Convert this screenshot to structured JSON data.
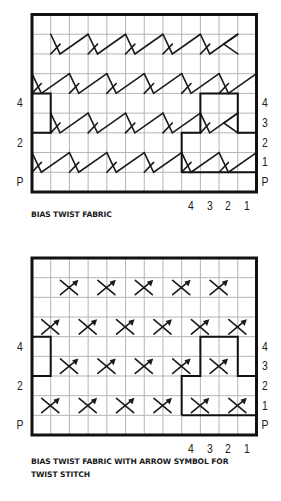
{
  "charts": [
    {
      "id": "bias-twist-fabric",
      "caption_lines": [
        "BIAS TWIST FABRIC"
      ],
      "symbol": "twist-line",
      "grid": {
        "cols": 12,
        "rows": 9,
        "left": 32,
        "top": 14.5,
        "right": 256.5,
        "bottom": 192
      },
      "left_labels": [
        {
          "row": 5,
          "text": "4"
        },
        {
          "row": 7,
          "text": "2"
        },
        {
          "row": 9,
          "text": "P"
        }
      ],
      "right_labels": [
        {
          "row": 5,
          "text": "4"
        },
        {
          "row": 6,
          "text": "3"
        },
        {
          "row": 7,
          "text": "2"
        },
        {
          "row": 8,
          "text": "1"
        },
        {
          "row": 9,
          "text": "P"
        }
      ],
      "bottom_labels": [
        {
          "col": 9,
          "text": "4"
        },
        {
          "col": 10,
          "text": "3"
        },
        {
          "col": 11,
          "text": "2"
        },
        {
          "col": 12,
          "text": "1"
        }
      ],
      "twists": [
        {
          "row": 2,
          "starts": [
            2,
            4,
            6,
            8,
            10
          ],
          "partial_end": 11
        },
        {
          "row": 4,
          "starts": [
            1,
            3,
            5,
            7,
            9,
            11
          ]
        },
        {
          "row": 6,
          "starts": [
            2,
            4,
            6,
            8,
            10
          ],
          "partial_end": 11
        },
        {
          "row": 8,
          "starts": [
            1,
            3,
            5,
            7,
            9,
            11
          ]
        }
      ],
      "caption_top": 208
    },
    {
      "id": "bias-twist-fabric-arrow",
      "caption_lines": [
        "BIAS TWIST FABRIC WITH ARROW SYMBOL FOR",
        "TWIST STITCH"
      ],
      "symbol": "arrow-cross",
      "grid": {
        "cols": 12,
        "rows": 9,
        "left": 32,
        "top": 258,
        "right": 256.5,
        "bottom": 435
      },
      "left_labels": [
        {
          "row": 5,
          "text": "4"
        },
        {
          "row": 7,
          "text": "2"
        },
        {
          "row": 9,
          "text": "P"
        }
      ],
      "right_labels": [
        {
          "row": 5,
          "text": "4"
        },
        {
          "row": 6,
          "text": "3"
        },
        {
          "row": 7,
          "text": "2"
        },
        {
          "row": 8,
          "text": "1"
        },
        {
          "row": 9,
          "text": "P"
        }
      ],
      "bottom_labels": [
        {
          "col": 9,
          "text": "4"
        },
        {
          "col": 10,
          "text": "3"
        },
        {
          "col": 11,
          "text": "2"
        },
        {
          "col": 12,
          "text": "1"
        }
      ],
      "crosses": [
        {
          "row": 2,
          "lines": [
            2,
            4,
            6,
            8,
            10
          ]
        },
        {
          "row": 4,
          "lines": [
            1,
            3,
            5,
            7,
            9,
            11
          ]
        },
        {
          "row": 6,
          "lines": [
            2,
            4,
            6,
            8,
            10
          ]
        },
        {
          "row": 8,
          "lines": [
            1,
            3,
            5,
            7,
            9,
            11
          ]
        }
      ],
      "caption_top": 455
    }
  ],
  "repeat_outline": {
    "left_box": {
      "col_from": 0,
      "col_to": 1,
      "row_from": 4,
      "row_to": 6
    },
    "right_path": [
      [
        8,
        8
      ],
      [
        8,
        6
      ],
      [
        9,
        6
      ],
      [
        9,
        4
      ],
      [
        11,
        4
      ],
      [
        11,
        6
      ],
      [
        12,
        6
      ]
    ],
    "right_bottom": [
      [
        8,
        8
      ],
      [
        12,
        8
      ]
    ]
  },
  "colors": {
    "grid": "#b5b5b5",
    "border": "#111111",
    "symbol": "#1a1a1a"
  }
}
